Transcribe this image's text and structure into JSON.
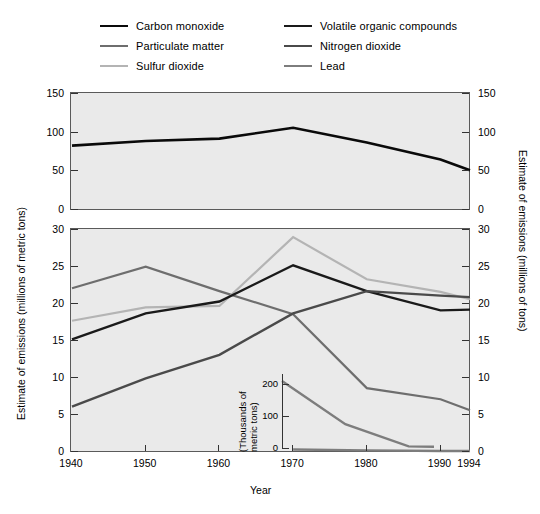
{
  "legend": {
    "items": [
      {
        "label": "Carbon monoxide",
        "color": "#0a0a0a",
        "width": 2.6,
        "column": "left"
      },
      {
        "label": "Particulate matter",
        "color": "#6e6e6e",
        "width": 2.2,
        "column": "left"
      },
      {
        "label": "Sulfur dioxide",
        "color": "#b4b4b4",
        "width": 2.2,
        "column": "left"
      },
      {
        "label": "Volatile organic compounds",
        "color": "#1a1a1a",
        "width": 2.4,
        "column": "right"
      },
      {
        "label": "Nitrogen dioxide",
        "color": "#4a4a4a",
        "width": 2.4,
        "column": "right"
      },
      {
        "label": "Lead",
        "color": "#7d7d7d",
        "width": 2.4,
        "column": "right"
      }
    ]
  },
  "axes": {
    "x_title": "Year",
    "x_ticklabels": [
      "1940",
      "1950",
      "1960",
      "1970",
      "1980",
      "1990",
      "1994"
    ],
    "left_title": "Estimate of emissions (millions of metric tons)",
    "right_title": "Estimate of emissions (millions of tons)",
    "top_yticklabels": [
      "0",
      "50",
      "100",
      "150"
    ],
    "bottom_yticklabels": [
      "0",
      "5",
      "10",
      "15",
      "20",
      "25",
      "30"
    ]
  },
  "inset": {
    "y_title_line1": "(Thousands of",
    "y_title_line2": "metric tons)",
    "yticklabels": [
      "0",
      "100",
      "200"
    ]
  },
  "chart_data": {
    "type": "line",
    "title": "",
    "xlabel": "Year",
    "grid": false,
    "legend_position": "top",
    "x": [
      1940,
      1950,
      1960,
      1970,
      1980,
      1990,
      1994
    ],
    "panels": [
      {
        "name": "top-panel",
        "ylabel": "Estimate of emissions (millions of metric tons)",
        "ylabel_right": "Estimate of emissions (millions of tons)",
        "ylim": [
          0,
          150
        ],
        "yticks": [
          0,
          50,
          100,
          150
        ],
        "series": [
          {
            "name": "Carbon monoxide",
            "color": "#0a0a0a",
            "width": 2.6,
            "values": [
              82,
              88,
              91,
              105,
              86,
              64,
              50
            ]
          }
        ]
      },
      {
        "name": "bottom-panel",
        "ylabel": "Estimate of emissions (millions of metric tons)",
        "ylabel_right": "Estimate of emissions (millions of tons)",
        "ylim": [
          0,
          30
        ],
        "yticks": [
          0,
          5,
          10,
          15,
          20,
          25,
          30
        ],
        "series": [
          {
            "name": "Particulate matter",
            "color": "#6e6e6e",
            "width": 2.2,
            "values": [
              22.0,
              24.9,
              21.6,
              18.5,
              8.5,
              7.0,
              5.5
            ]
          },
          {
            "name": "Sulfur dioxide",
            "color": "#b4b4b4",
            "width": 2.2,
            "values": [
              17.6,
              19.4,
              19.6,
              28.9,
              23.2,
              21.5,
              20.5
            ]
          },
          {
            "name": "Volatile organic compounds",
            "color": "#1a1a1a",
            "width": 2.4,
            "values": [
              15.1,
              18.6,
              20.2,
              25.1,
              21.6,
              19.0,
              19.1
            ]
          },
          {
            "name": "Nitrogen dioxide",
            "color": "#4a4a4a",
            "width": 2.4,
            "values": [
              6.0,
              9.8,
              13.0,
              18.6,
              21.6,
              21.0,
              20.8
            ]
          },
          {
            "name": "Lead",
            "color": "#7d7d7d",
            "width": 2.4,
            "values": [
              null,
              null,
              null,
              0.21,
              0.08,
              0.006,
              0.005
            ]
          }
        ]
      }
    ],
    "inset": {
      "name": "lead-inset",
      "ylabel": "(Thousands of metric tons)",
      "ylim": [
        0,
        230
      ],
      "yticks": [
        0,
        100,
        200
      ],
      "x": [
        1970,
        1980,
        1990,
        1994
      ],
      "series": [
        {
          "name": "Lead",
          "color": "#7d7d7d",
          "width": 2.4,
          "values": [
            208,
            74,
            5,
            4
          ]
        }
      ]
    }
  }
}
